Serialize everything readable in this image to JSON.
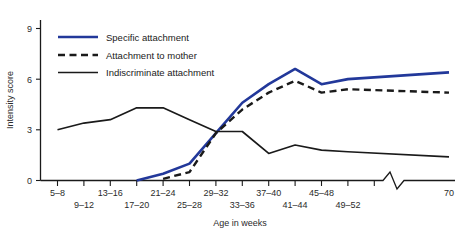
{
  "chart_data": {
    "type": "line",
    "title": "",
    "xlabel": "Age in weeks",
    "ylabel": "Intensity score",
    "ylim": [
      0,
      9.6
    ],
    "yticks": [
      0,
      3,
      6,
      9
    ],
    "ytick_labels": [
      "0",
      "3",
      "6",
      "9"
    ],
    "grid": false,
    "legend_position": "upper-left",
    "axis_break": {
      "present": true,
      "location": "x-axis near right end",
      "glyph": "zigzag"
    },
    "categories": [
      "5–8",
      "9–12",
      "13–16",
      "17–20",
      "21–24",
      "25–28",
      "29–32",
      "33–36",
      "37–40",
      "41–44",
      "45–48",
      "49–52",
      "70"
    ],
    "series": [
      {
        "name": "Specific attachment",
        "color": "#22389a",
        "style": "solid",
        "values": [
          null,
          null,
          null,
          0.0,
          0.4,
          1.0,
          2.8,
          4.6,
          5.7,
          6.6,
          5.7,
          6.0,
          6.4
        ]
      },
      {
        "name": "Attachment to mother",
        "color": "#1a1a1a",
        "style": "dashed",
        "values": [
          null,
          null,
          null,
          null,
          0.1,
          0.5,
          2.8,
          4.2,
          5.2,
          5.9,
          5.2,
          5.4,
          5.2
        ]
      },
      {
        "name": "Indiscriminate attachment",
        "color": "#1a1a1a",
        "style": "solid",
        "values": [
          3.0,
          3.4,
          3.6,
          4.3,
          4.3,
          3.6,
          2.9,
          2.9,
          1.6,
          2.1,
          1.8,
          1.7,
          1.4
        ]
      }
    ]
  },
  "axis": {
    "y_title": "Intensity score",
    "x_title": "Age in weeks",
    "y_tick_labels": [
      "9",
      "6",
      "3",
      "0"
    ],
    "x_tick_labels_top": [
      "5–8",
      "13–16",
      "21–24",
      "29–32",
      "37–40",
      "45–48",
      "70"
    ],
    "x_tick_labels_bottom": [
      "9–12",
      "17–20",
      "25–28",
      "33–36",
      "41–44",
      "49–52"
    ]
  },
  "legend": {
    "items": [
      {
        "label": "Specific attachment",
        "color": "#22389a",
        "style": "solid"
      },
      {
        "label": "Attachment to mother",
        "color": "#1a1a1a",
        "style": "dashed"
      },
      {
        "label": "Indiscriminate attachment",
        "color": "#1a1a1a",
        "style": "solid"
      }
    ]
  }
}
